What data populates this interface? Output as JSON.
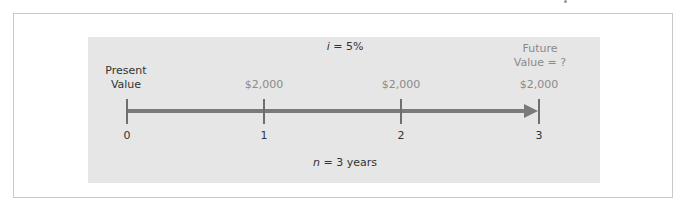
{
  "diagram": {
    "type": "cash-flow-timeline",
    "interest_rate_label": {
      "var": "i",
      "rest": " = 5%"
    },
    "period_label": {
      "var": "n",
      "rest": " = 3 years"
    },
    "present_value": {
      "line1": "Present",
      "line2": "Value"
    },
    "future_value": {
      "line1": "Future",
      "line2": "Value = ?"
    },
    "periods": [
      {
        "index": "0",
        "cash_flow": ""
      },
      {
        "index": "1",
        "cash_flow": "$2,000"
      },
      {
        "index": "2",
        "cash_flow": "$2,000"
      },
      {
        "index": "3",
        "cash_flow": "$2,000"
      }
    ],
    "colors": {
      "panel": "#e6e6e6",
      "line": "#7a7a7a",
      "text": "#333333",
      "muted_text": "#8a8a8a",
      "frame": "#c9c9c9"
    }
  }
}
